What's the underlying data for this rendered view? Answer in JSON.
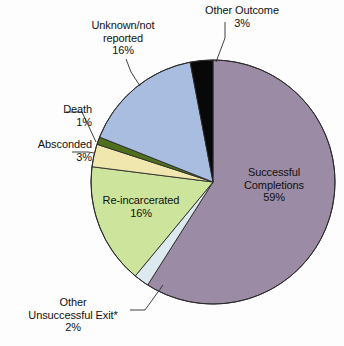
{
  "chart_data": {
    "type": "pie",
    "title": "",
    "subtitle": "",
    "legend_position": "none",
    "grid": false,
    "label_unit": "%",
    "total": 100,
    "footnote_marker": "*",
    "categories": [
      "Successful Completions",
      "Other Unsuccessful Exit*",
      "Re-incarcerated",
      "Absconded",
      "Death",
      "Unknown/not reported",
      "Other Outcome"
    ],
    "values": [
      59,
      2,
      16,
      3,
      1,
      16,
      3
    ],
    "colors": [
      "#9c8ba4",
      "#dce9ef",
      "#cce49b",
      "#efe7ad",
      "#4f6f1c",
      "#a9bde1",
      "#080808"
    ],
    "slices": [
      {
        "name": "Successful Completions",
        "label_line1": "Successful",
        "label_line2": "Completions",
        "value": 59,
        "value_label": "59%",
        "color": "#9c8ba4",
        "label_placement": "inside"
      },
      {
        "name": "Other Unsuccessful Exit*",
        "label_line1": "Other",
        "label_line2": "Unsuccessful Exit*",
        "value": 2,
        "value_label": "2%",
        "color": "#dce9ef",
        "label_placement": "outside"
      },
      {
        "name": "Re-incarcerated",
        "label_line1": "Re-incarcerated",
        "label_line2": "",
        "value": 16,
        "value_label": "16%",
        "color": "#cce49b",
        "label_placement": "inside"
      },
      {
        "name": "Absconded",
        "label_line1": "Absconded",
        "label_line2": "",
        "value": 3,
        "value_label": "3%",
        "color": "#efe7ad",
        "label_placement": "outside"
      },
      {
        "name": "Death",
        "label_line1": "Death",
        "label_line2": "",
        "value": 1,
        "value_label": "1%",
        "color": "#4f6f1c",
        "label_placement": "outside"
      },
      {
        "name": "Unknown/not reported",
        "label_line1": "Unknown/not",
        "label_line2": "reported",
        "value": 16,
        "value_label": "16%",
        "color": "#a9bde1",
        "label_placement": "outside"
      },
      {
        "name": "Other Outcome",
        "label_line1": "Other Outcome",
        "label_line2": "",
        "value": 3,
        "value_label": "3%",
        "color": "#080808",
        "label_placement": "outside"
      }
    ]
  },
  "labels": {
    "other_outcome": {
      "line1": "Other Outcome",
      "pct": "3%"
    },
    "unknown": {
      "line1": "Unknown/not",
      "line2": "reported",
      "pct": "16%"
    },
    "death": {
      "line1": "Death",
      "pct": "1%"
    },
    "absconded": {
      "line1": "Absconded",
      "pct": "3%"
    },
    "other_unsuccessful": {
      "line1": "Other",
      "line2": "Unsuccessful Exit*",
      "pct": "2%"
    },
    "successful": {
      "line1": "Successful",
      "line2": "Completions",
      "pct": "59%"
    },
    "reincarcerated": {
      "line1": "Re-incarcerated",
      "pct": "16%"
    }
  },
  "style": {
    "background": "#fdfdfd",
    "outline": "#2b2b2b",
    "text": "#111111"
  }
}
